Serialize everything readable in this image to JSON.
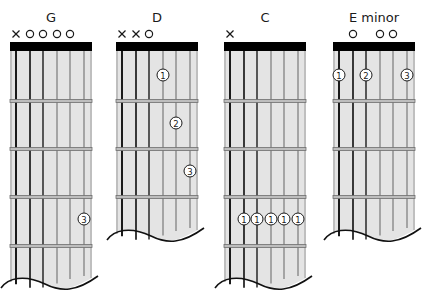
{
  "diagram": {
    "strings_count": 6,
    "colors": {
      "board": "#e4e4e4",
      "board_edge": "#9a9a9a",
      "nut": "#000000",
      "fret": "#6e6e6e",
      "string_dark": "#1a1a1a",
      "string_light": "#7a7a7a",
      "marker": "#1a1a1a",
      "finger_fill": "#ffffff"
    },
    "chords": [
      {
        "name": "G",
        "frets_shown": 5,
        "markers": [
          "x",
          "o",
          "o",
          "o",
          "o",
          null
        ],
        "fingers": [
          {
            "string": 6,
            "fret": 5,
            "label": "3"
          }
        ]
      },
      {
        "name": "D",
        "frets_shown": 4,
        "markers": [
          "x",
          "x",
          "o",
          null,
          null,
          null
        ],
        "fingers": [
          {
            "string": 4,
            "fret": 2,
            "label": "1"
          },
          {
            "string": 5,
            "fret": 3,
            "label": "2"
          },
          {
            "string": 6,
            "fret": 4,
            "label": "3"
          }
        ]
      },
      {
        "name": "C",
        "frets_shown": 5,
        "markers": [
          "x",
          null,
          null,
          null,
          null,
          null
        ],
        "fingers": [
          {
            "string": 2,
            "fret": 5,
            "label": "1"
          },
          {
            "string": 3,
            "fret": 5,
            "label": "1"
          },
          {
            "string": 4,
            "fret": 5,
            "label": "1"
          },
          {
            "string": 5,
            "fret": 5,
            "label": "1"
          },
          {
            "string": 6,
            "fret": 5,
            "label": "1"
          }
        ]
      },
      {
        "name": "E minor",
        "frets_shown": 4,
        "markers": [
          null,
          "o",
          null,
          "o",
          "o",
          null
        ],
        "fingers": [
          {
            "string": 1,
            "fret": 2,
            "label": "1"
          },
          {
            "string": 3,
            "fret": 2,
            "label": "2"
          },
          {
            "string": 6,
            "fret": 2,
            "label": "3"
          }
        ]
      }
    ]
  }
}
